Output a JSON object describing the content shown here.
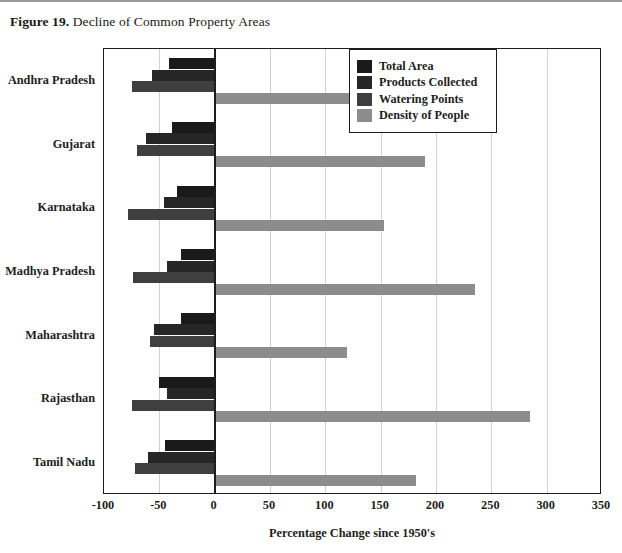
{
  "figure": {
    "label": "Figure 19.",
    "caption": " Decline of Common Property Areas"
  },
  "legend": {
    "position": "top-right",
    "items": [
      {
        "label": "Total Area",
        "color": "#1a1a1a"
      },
      {
        "label": "Products Collected",
        "color": "#262626"
      },
      {
        "label": "Watering Points",
        "color": "#3f3f3f"
      },
      {
        "label": "Density of People",
        "color": "#8c8c8c"
      }
    ]
  },
  "axes": {
    "xlabel": "Percentage Change since 1950's",
    "xticks": [
      -100,
      -50,
      0,
      50,
      100,
      150,
      200,
      250,
      300,
      350
    ],
    "xmin": -100,
    "xmax": 350,
    "zero_value": 0
  },
  "chart_data": {
    "type": "bar",
    "orientation": "horizontal",
    "title": "Decline of Common Property Areas",
    "xlabel": "Percentage Change since 1950's",
    "ylabel": "",
    "xlim": [
      -100,
      350
    ],
    "grid": true,
    "legend_position": "top-right",
    "categories": [
      "Andhra Pradesh",
      "Gujarat",
      "Karnataka",
      "Madhya Pradesh",
      "Maharashtra",
      "Rajasthan",
      "Tamil Nadu"
    ],
    "series": [
      {
        "name": "Total Area",
        "color": "#1a1a1a",
        "values": [
          -41,
          -39,
          -34,
          -30,
          -30,
          -50,
          -45
        ]
      },
      {
        "name": "Products Collected",
        "color": "#262626",
        "values": [
          -57,
          -62,
          -46,
          -43,
          -55,
          -43,
          -60
        ]
      },
      {
        "name": "Watering Points",
        "color": "#3f3f3f",
        "values": [
          -75,
          -70,
          -78,
          -74,
          -58,
          -75,
          -72
        ]
      },
      {
        "name": "Density of People",
        "color": "#8c8c8c",
        "values": [
          180,
          190,
          153,
          235,
          120,
          285,
          182
        ]
      }
    ]
  },
  "footer": {
    "text": ""
  }
}
